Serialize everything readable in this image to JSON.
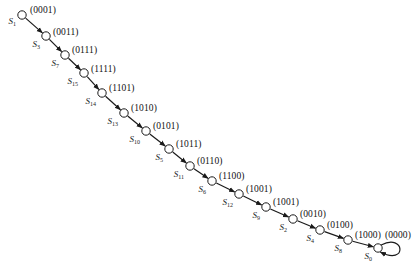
{
  "figure": {
    "background_color": "#ffffff",
    "node_stroke_color": "#1a1a1a",
    "edge_color": "#1a1a1a",
    "text_color": "#111111"
  },
  "states": [
    {
      "name": "S",
      "subscript": "1",
      "binary": "(0001)",
      "node_x": 22,
      "node_y": 15,
      "label_x": 16,
      "label_y": 22,
      "binary_x": 30,
      "binary_y": 11
    },
    {
      "name": "S",
      "subscript": "3",
      "binary": "(0011)",
      "node_x": 46,
      "node_y": 36,
      "label_x": 40,
      "label_y": 45,
      "binary_x": 53,
      "binary_y": 33
    },
    {
      "name": "S",
      "subscript": "7",
      "binary": "(0111)",
      "node_x": 65,
      "node_y": 55,
      "label_x": 59,
      "label_y": 64,
      "binary_x": 72,
      "binary_y": 51
    },
    {
      "name": "S",
      "subscript": "15",
      "binary": "(1111)",
      "node_x": 84,
      "node_y": 73,
      "label_x": 78,
      "label_y": 82,
      "binary_x": 91,
      "binary_y": 70
    },
    {
      "name": "S",
      "subscript": "14",
      "binary": "(1101)",
      "node_x": 102,
      "node_y": 93,
      "label_x": 96,
      "label_y": 102,
      "binary_x": 109,
      "binary_y": 89
    },
    {
      "name": "S",
      "subscript": "13",
      "binary": "(1010)",
      "node_x": 124,
      "node_y": 113,
      "label_x": 118,
      "label_y": 122,
      "binary_x": 131,
      "binary_y": 109
    },
    {
      "name": "S",
      "subscript": "10",
      "binary": "(0101)",
      "node_x": 146,
      "node_y": 131,
      "label_x": 140,
      "label_y": 140,
      "binary_x": 153,
      "binary_y": 127
    },
    {
      "name": "S",
      "subscript": "5",
      "binary": "(1011)",
      "node_x": 169,
      "node_y": 149,
      "label_x": 163,
      "label_y": 158,
      "binary_x": 176,
      "binary_y": 145
    },
    {
      "name": "S",
      "subscript": "11",
      "binary": "(0110)",
      "node_x": 190,
      "node_y": 166,
      "label_x": 184,
      "label_y": 175,
      "binary_x": 197,
      "binary_y": 162
    },
    {
      "name": "S",
      "subscript": "6",
      "binary": "(1100)",
      "node_x": 212,
      "node_y": 181,
      "label_x": 206,
      "label_y": 190,
      "binary_x": 219,
      "binary_y": 177
    },
    {
      "name": "S",
      "subscript": "12",
      "binary": "(1001)",
      "node_x": 239,
      "node_y": 194,
      "label_x": 233,
      "label_y": 203,
      "binary_x": 246,
      "binary_y": 190
    },
    {
      "name": "S",
      "subscript": "9",
      "binary": "(1001)",
      "node_x": 266,
      "node_y": 207,
      "label_x": 260,
      "label_y": 216,
      "binary_x": 273,
      "binary_y": 203
    },
    {
      "name": "S",
      "subscript": "2",
      "binary": "(0010)",
      "node_x": 293,
      "node_y": 219,
      "label_x": 287,
      "label_y": 228,
      "binary_x": 300,
      "binary_y": 215
    },
    {
      "name": "S",
      "subscript": "4",
      "binary": "(0100)",
      "node_x": 320,
      "node_y": 230,
      "label_x": 314,
      "label_y": 239,
      "binary_x": 327,
      "binary_y": 226
    },
    {
      "name": "S",
      "subscript": "8",
      "binary": "(1000)",
      "node_x": 348,
      "node_y": 240,
      "label_x": 342,
      "label_y": 249,
      "binary_x": 355,
      "binary_y": 236
    },
    {
      "name": "S",
      "subscript": "0",
      "binary": "(0000)",
      "node_x": 378,
      "node_y": 248,
      "label_x": 372,
      "label_y": 257,
      "binary_x": 385,
      "binary_y": 236
    }
  ],
  "self_loop": {
    "at_state_index": 15,
    "description": "self-transition loop on final state"
  },
  "node": {
    "radius": 4.2,
    "stroke_width": 1.0
  },
  "edges": {
    "stroke_width": 1.2,
    "arrowhead": "filled-triangle"
  }
}
